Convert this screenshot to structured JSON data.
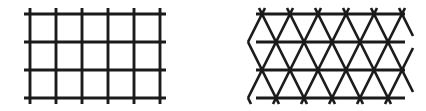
{
  "image": {
    "title": "Two lattice diagrams",
    "width": 426,
    "height": 111,
    "background_color": "#ffffff",
    "ink_color": "#1b1b1b",
    "figure_count": 2
  },
  "figures": [
    {
      "id": "square-lattice",
      "label": "Square lattice",
      "position": "left",
      "lattice_type": "square",
      "description": "Orthogonal grid of 6 vertical lines crossed by 4 horizontal lines, forming 5 by 3 square cells with short overhanging ends.",
      "vertical_line_count": 6,
      "horizontal_line_count": 4,
      "cell_columns": 5,
      "cell_rows": 3,
      "vertical_spacing_px": 26,
      "horizontal_spacing_px": 28,
      "bounds": {
        "x1": 30,
        "y1": 14,
        "x2": 160,
        "y2": 98
      },
      "overhang_px": 6,
      "vertical_x": [
        30,
        56,
        82,
        108,
        134,
        160
      ],
      "horizontal_y": [
        14,
        42,
        70,
        98
      ],
      "stroke_width": 2.9,
      "color": "#1b1b1b"
    },
    {
      "id": "triangular-lattice",
      "label": "Triangular lattice",
      "position": "right",
      "lattice_type": "triangular",
      "description": "Isometric triangular net: 4 horizontal lines crossed by two families of diagonals at plus and minus 60 degrees, making X shaped crossings centered on each horizontal line.",
      "horizontal_line_count": 4,
      "diagonal_families": 2,
      "diagonal_angle_deg": 60,
      "node_spacing_px": 28,
      "row_offset_px": 14,
      "bounds": {
        "x1": 258,
        "y1": 14,
        "x2": 403,
        "y2": 98
      },
      "overhang_px": 6,
      "horizontal_y": [
        14,
        42,
        70,
        98
      ],
      "row_nodes": [
        [
          262,
          290,
          318,
          346,
          374
        ],
        [
          276,
          304,
          332,
          360,
          388
        ],
        [
          262,
          290,
          318,
          346,
          374
        ],
        [
          276,
          304,
          332,
          360,
          388
        ]
      ],
      "stroke_width": 2.6,
      "color": "#1b1b1b"
    }
  ]
}
